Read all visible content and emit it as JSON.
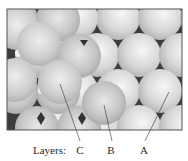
{
  "figure": {
    "caption_prefix": "Layers:",
    "labels": [
      {
        "text": "C",
        "x": 80,
        "pointer_to": [
          60,
          84
        ]
      },
      {
        "text": "B",
        "x": 111,
        "pointer_to": [
          104,
          105
        ]
      },
      {
        "text": "A",
        "x": 144,
        "pointer_to": [
          169,
          92
        ]
      }
    ],
    "colors": {
      "frame": "#555555",
      "void": "#3a3a3a",
      "sphere_light": "#f4f4f4",
      "sphere_dark": "#9a9a9a",
      "text": "#2a2a2a"
    }
  }
}
